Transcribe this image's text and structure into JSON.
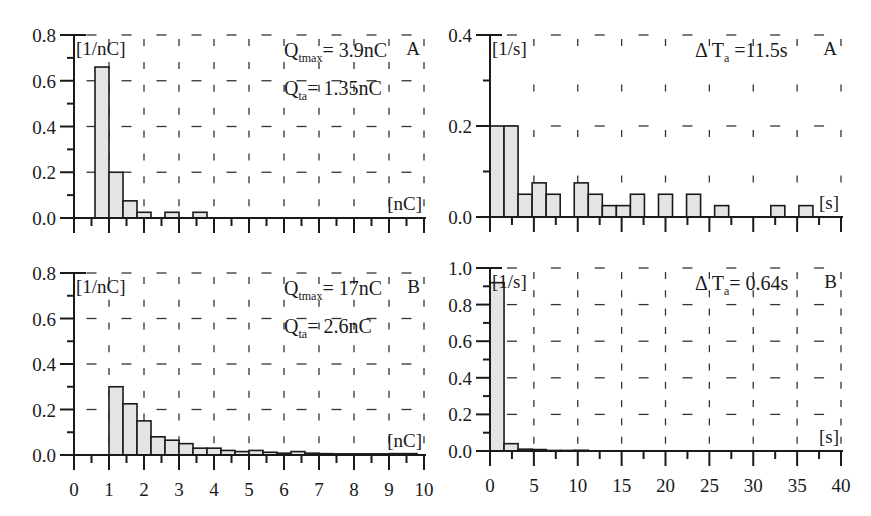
{
  "figure": {
    "colors": {
      "axis": "#1a1a1a",
      "bar_fill": "#e4e4e4",
      "bar_stroke": "#1a1a1a",
      "grid": "#333333"
    }
  },
  "chart_data": [
    {
      "id": "top-left",
      "panel": "A",
      "type": "bar",
      "title": "",
      "unit_y": "[1/nC]",
      "unit_x": "[nC]",
      "xlim": [
        0,
        10
      ],
      "ylim": [
        0,
        0.8
      ],
      "yticks": [
        "0.0",
        "0.2",
        "0.4",
        "0.6",
        "0.8"
      ],
      "xticks": [],
      "annotations": [
        {
          "symbol": "Q",
          "sub": "tmax",
          "text": "= 3.9nC"
        },
        {
          "symbol": "Q",
          "sub": "ta",
          "text": "= 1.35nC"
        }
      ],
      "bin_width": 0.4,
      "bins": [
        {
          "x0": 0.6,
          "x1": 1.0,
          "value": 0.66
        },
        {
          "x0": 1.0,
          "x1": 1.4,
          "value": 0.2
        },
        {
          "x0": 1.4,
          "x1": 1.8,
          "value": 0.075
        },
        {
          "x0": 1.8,
          "x1": 2.2,
          "value": 0.025
        },
        {
          "x0": 2.6,
          "x1": 3.0,
          "value": 0.025
        },
        {
          "x0": 3.4,
          "x1": 3.8,
          "value": 0.025
        }
      ],
      "grid": true
    },
    {
      "id": "top-right",
      "panel": "A",
      "type": "bar",
      "title": "",
      "unit_y": "[1/s]",
      "unit_x": "[s]",
      "xlim": [
        0,
        40
      ],
      "ylim": [
        0,
        0.4
      ],
      "yticks": [
        "0.0",
        "0.2",
        "0.4"
      ],
      "xticks": [],
      "annotations": [
        {
          "symbol": "Δ T",
          "sub": "a",
          "text": " =11.5s"
        }
      ],
      "bin_width": 1.6,
      "bins": [
        {
          "x0": 0.0,
          "x1": 1.6,
          "value": 0.2
        },
        {
          "x0": 1.6,
          "x1": 3.2,
          "value": 0.2
        },
        {
          "x0": 3.2,
          "x1": 4.8,
          "value": 0.05
        },
        {
          "x0": 4.8,
          "x1": 6.4,
          "value": 0.075
        },
        {
          "x0": 6.4,
          "x1": 8.0,
          "value": 0.05
        },
        {
          "x0": 9.6,
          "x1": 11.2,
          "value": 0.075
        },
        {
          "x0": 11.2,
          "x1": 12.8,
          "value": 0.05
        },
        {
          "x0": 12.8,
          "x1": 14.4,
          "value": 0.025
        },
        {
          "x0": 14.4,
          "x1": 16.0,
          "value": 0.025
        },
        {
          "x0": 16.0,
          "x1": 17.6,
          "value": 0.05
        },
        {
          "x0": 19.2,
          "x1": 20.8,
          "value": 0.05
        },
        {
          "x0": 22.4,
          "x1": 24.0,
          "value": 0.05
        },
        {
          "x0": 25.6,
          "x1": 27.2,
          "value": 0.025
        },
        {
          "x0": 32.0,
          "x1": 33.6,
          "value": 0.025
        },
        {
          "x0": 35.2,
          "x1": 36.8,
          "value": 0.025
        }
      ],
      "grid": true
    },
    {
      "id": "bottom-left",
      "panel": "B",
      "type": "bar",
      "title": "",
      "unit_y": "[1/nC]",
      "unit_x": "[nC]",
      "xlim": [
        0,
        10
      ],
      "ylim": [
        0,
        0.8
      ],
      "yticks": [
        "0.0",
        "0.2",
        "0.4",
        "0.6",
        "0.8"
      ],
      "xticks": [
        "0",
        "1",
        "2",
        "3",
        "4",
        "5",
        "6",
        "7",
        "8",
        "9",
        "10"
      ],
      "annotations": [
        {
          "symbol": "Q",
          "sub": "tmax",
          "text": "= 17nC"
        },
        {
          "symbol": "Q",
          "sub": "ta",
          "text": "= 2.6nC"
        }
      ],
      "bin_width": 0.4,
      "bins": [
        {
          "x0": 1.0,
          "x1": 1.4,
          "value": 0.3
        },
        {
          "x0": 1.4,
          "x1": 1.8,
          "value": 0.225
        },
        {
          "x0": 1.8,
          "x1": 2.2,
          "value": 0.15
        },
        {
          "x0": 2.2,
          "x1": 2.6,
          "value": 0.08
        },
        {
          "x0": 2.6,
          "x1": 3.0,
          "value": 0.065
        },
        {
          "x0": 3.0,
          "x1": 3.4,
          "value": 0.05
        },
        {
          "x0": 3.4,
          "x1": 3.8,
          "value": 0.03
        },
        {
          "x0": 3.8,
          "x1": 4.2,
          "value": 0.03
        },
        {
          "x0": 4.2,
          "x1": 4.6,
          "value": 0.02
        },
        {
          "x0": 4.6,
          "x1": 5.0,
          "value": 0.015
        },
        {
          "x0": 5.0,
          "x1": 5.4,
          "value": 0.02
        },
        {
          "x0": 5.4,
          "x1": 5.8,
          "value": 0.012
        },
        {
          "x0": 5.8,
          "x1": 6.2,
          "value": 0.008
        },
        {
          "x0": 6.2,
          "x1": 6.6,
          "value": 0.015
        },
        {
          "x0": 6.6,
          "x1": 7.0,
          "value": 0.008
        },
        {
          "x0": 7.0,
          "x1": 7.4,
          "value": 0.006
        },
        {
          "x0": 7.4,
          "x1": 7.8,
          "value": 0.005
        },
        {
          "x0": 7.8,
          "x1": 8.2,
          "value": 0.005
        },
        {
          "x0": 8.2,
          "x1": 8.6,
          "value": 0.005
        },
        {
          "x0": 8.6,
          "x1": 9.0,
          "value": 0.005
        },
        {
          "x0": 9.0,
          "x1": 9.4,
          "value": 0.006
        },
        {
          "x0": 9.4,
          "x1": 9.8,
          "value": 0.006
        }
      ],
      "xlabel": "",
      "grid": true
    },
    {
      "id": "bottom-right",
      "panel": "B",
      "type": "bar",
      "title": "",
      "unit_y": "[1/s]",
      "unit_x": "[s]",
      "xlim": [
        0,
        40
      ],
      "ylim": [
        0,
        1.0
      ],
      "yticks": [
        "0.0",
        "0.2",
        "0.4",
        "0.6",
        "0.8",
        "1.0"
      ],
      "xticks": [
        "0",
        "5",
        "10",
        "15",
        "20",
        "25",
        "30",
        "35",
        "40"
      ],
      "annotations": [
        {
          "symbol": "Δ T",
          "sub": "a",
          "text": "= 0.64s"
        }
      ],
      "bin_width": 1.6,
      "bins": [
        {
          "x0": 0.0,
          "x1": 1.6,
          "value": 0.92
        },
        {
          "x0": 1.6,
          "x1": 3.2,
          "value": 0.04
        },
        {
          "x0": 3.2,
          "x1": 4.8,
          "value": 0.01
        },
        {
          "x0": 4.8,
          "x1": 6.4,
          "value": 0.008
        },
        {
          "x0": 6.4,
          "x1": 8.0,
          "value": 0.003
        },
        {
          "x0": 8.0,
          "x1": 9.6,
          "value": 0.003
        },
        {
          "x0": 9.6,
          "x1": 11.2,
          "value": 0.004
        }
      ],
      "grid": true
    }
  ]
}
